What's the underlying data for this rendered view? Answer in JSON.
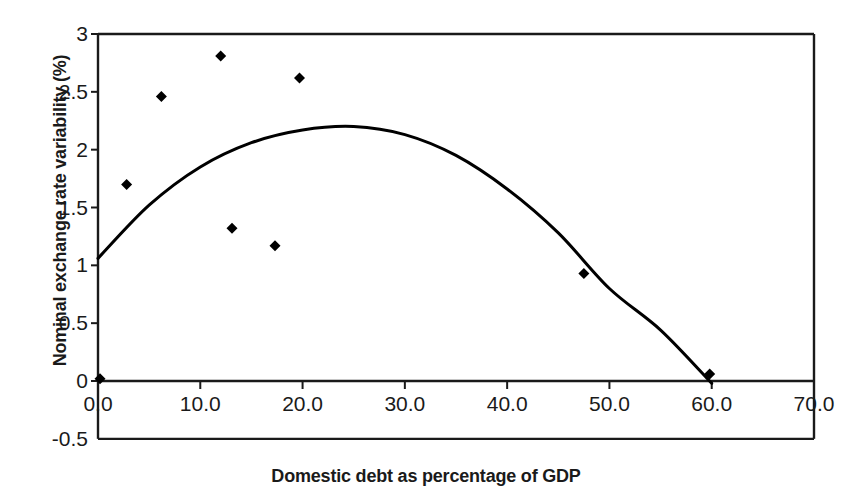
{
  "chart_data": {
    "type": "scatter",
    "title": "",
    "xlabel": "Domestic debt as percentage of GDP",
    "ylabel": "Nominal exchange rate variability (%)",
    "xlim": [
      0.0,
      70.0
    ],
    "ylim": [
      -0.5,
      3.0
    ],
    "xticks": [
      "0.0",
      "10.0",
      "20.0",
      "30.0",
      "40.0",
      "50.0",
      "60.0",
      "70.0"
    ],
    "xtick_values": [
      0.0,
      10.0,
      20.0,
      30.0,
      40.0,
      50.0,
      60.0,
      70.0
    ],
    "yticks": [
      "-0.5",
      "0",
      "0.5",
      "1",
      "1.5",
      "2",
      "2.5",
      "3"
    ],
    "ytick_values": [
      -0.5,
      0,
      0.5,
      1,
      1.5,
      2,
      2.5,
      3
    ],
    "grid": false,
    "legend": "none",
    "marker": "filled-diamond",
    "marker_color": "#000000",
    "line_color": "#000000",
    "points": [
      {
        "x": 0.2,
        "y": 0.02
      },
      {
        "x": 2.8,
        "y": 1.7
      },
      {
        "x": 6.2,
        "y": 2.46
      },
      {
        "x": 12.0,
        "y": 2.81
      },
      {
        "x": 13.1,
        "y": 1.32
      },
      {
        "x": 17.3,
        "y": 1.17
      },
      {
        "x": 19.7,
        "y": 2.62
      },
      {
        "x": 47.5,
        "y": 0.93
      },
      {
        "x": 59.8,
        "y": 0.06
      }
    ],
    "fit_curve": {
      "name": "quadratic trendline",
      "kind": "quadratic",
      "vertex": {
        "x": 24.8,
        "y": 2.2
      },
      "x_start": 0.0,
      "y_start": 1.06,
      "x_end": 60.0,
      "y_end": -0.02,
      "samples": [
        {
          "x": 0.0,
          "y": 1.06
        },
        {
          "x": 5.0,
          "y": 1.52
        },
        {
          "x": 10.0,
          "y": 1.85
        },
        {
          "x": 15.0,
          "y": 2.06
        },
        {
          "x": 20.0,
          "y": 2.17
        },
        {
          "x": 25.0,
          "y": 2.2
        },
        {
          "x": 30.0,
          "y": 2.13
        },
        {
          "x": 35.0,
          "y": 1.95
        },
        {
          "x": 40.0,
          "y": 1.66
        },
        {
          "x": 45.0,
          "y": 1.28
        },
        {
          "x": 50.0,
          "y": 0.8
        },
        {
          "x": 55.0,
          "y": 0.44
        },
        {
          "x": 60.0,
          "y": -0.02
        }
      ]
    }
  }
}
